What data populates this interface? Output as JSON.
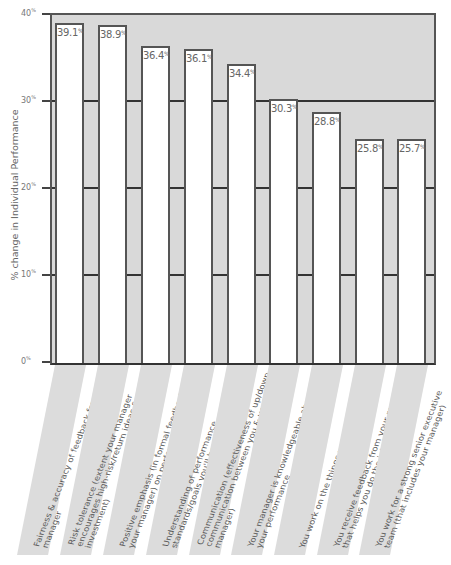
{
  "chart_data": {
    "type": "bar",
    "title": "",
    "xlabel": "",
    "ylabel": "% change in Individual Performance",
    "ylim": [
      0,
      40
    ],
    "yticks": [
      "0%",
      "10%",
      "20%",
      "30%",
      "40%"
    ],
    "grid": true,
    "legend": null,
    "categories": [
      "Fairness & accuracy of feedback from your manager",
      "Risk tolerance (extent your manager encourages high-risk/return ideas & investment)",
      "Positive emphasis (in formal feedback from your manager) on performance strengths",
      "Understanding of performance standards/goals you'll be evaluated on",
      "Communication (effectiveness of up/down communication between you & your manager)",
      "Your manager is knowledgeable about your performance",
      "You work on the things you do best",
      "You receive feedback from your manager that helps you do the job better",
      "You work for a strong senior executive team (that includes your manager)"
    ],
    "values": [
      39.1,
      38.9,
      36.4,
      36.1,
      34.4,
      30.3,
      28.8,
      25.8,
      25.7
    ],
    "value_labels": [
      "39.1",
      "38.9",
      "36.4",
      "36.1",
      "34.4",
      "30.3",
      "28.8",
      "25.8",
      "25.7"
    ],
    "value_suffix": "%"
  },
  "axis": {
    "ylabel": "% change in Individual Performance",
    "ticks": [
      {
        "num": "0",
        "sfx": "%"
      },
      {
        "num": "10",
        "sfx": "%"
      },
      {
        "num": "20",
        "sfx": "%"
      },
      {
        "num": "30",
        "sfx": "%"
      },
      {
        "num": "40",
        "sfx": "%"
      }
    ]
  },
  "colors": {
    "plot_background": "#d9d9d9",
    "bar_fill": "#ffffff",
    "bar_outline": "#555555",
    "label_strip": "#dcdcdc"
  }
}
